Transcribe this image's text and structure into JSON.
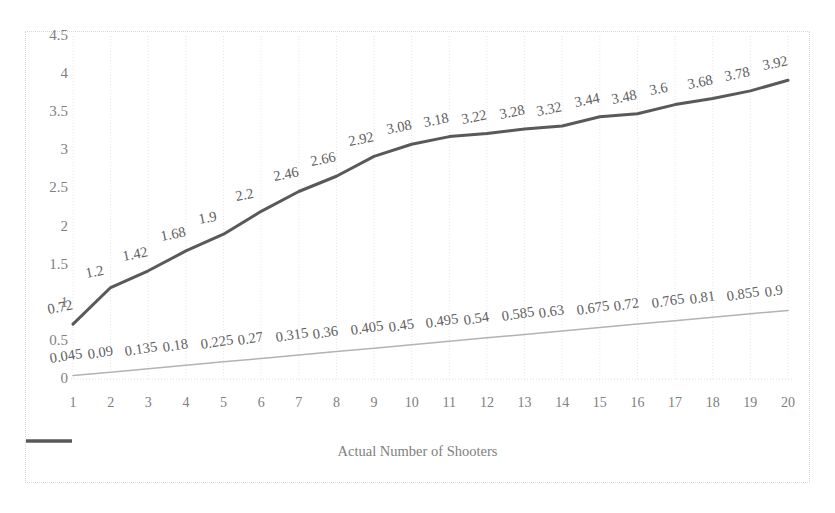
{
  "chart": {
    "background_color": "#ffffff",
    "border_color": "#d9d9d9",
    "gridline_color": "#e6e6e6",
    "axis_label_color": "#808080",
    "data_label_color": "#606060"
  },
  "legend": {
    "position": "bottom",
    "swatch_color": "#595959",
    "label": "Actual Number of Shooters"
  },
  "chart_data": {
    "type": "line",
    "title": "",
    "xlabel": "",
    "ylabel": "",
    "xlim": [
      1,
      20
    ],
    "ylim": [
      0,
      4.5
    ],
    "ytick_labels": [
      "0",
      "0.5",
      "1",
      "1.5",
      "2",
      "2.5",
      "3",
      "3.5",
      "4",
      "4.5"
    ],
    "ytick_values": [
      0,
      0.5,
      1,
      1.5,
      2,
      2.5,
      3,
      3.5,
      4,
      4.5
    ],
    "categories": [
      "1",
      "2",
      "3",
      "4",
      "5",
      "6",
      "7",
      "8",
      "9",
      "10",
      "11",
      "12",
      "13",
      "14",
      "15",
      "16",
      "17",
      "18",
      "19",
      "20"
    ],
    "grid": "vertical",
    "legend_position": "bottom",
    "series": [
      {
        "name": "Actual Number of Shooters",
        "color": "#595959",
        "width": 3,
        "labels_shown": true,
        "values": [
          0.72,
          1.2,
          1.42,
          1.68,
          1.9,
          2.2,
          2.46,
          2.66,
          2.92,
          3.08,
          3.18,
          3.22,
          3.28,
          3.32,
          3.44,
          3.48,
          3.6,
          3.68,
          3.78,
          3.92
        ],
        "value_labels": [
          "0.72",
          "1.2",
          "1.42",
          "1.68",
          "1.9",
          "2.2",
          "2.46",
          "2.66",
          "2.92",
          "3.08",
          "3.18",
          "3.22",
          "3.28",
          "3.32",
          "3.44",
          "3.48",
          "3.6",
          "3.68",
          "3.78",
          "3.92"
        ]
      },
      {
        "name": "",
        "color": "#b3b3b3",
        "width": 1.5,
        "labels_shown": true,
        "values": [
          0.045,
          0.09,
          0.135,
          0.18,
          0.225,
          0.27,
          0.315,
          0.36,
          0.405,
          0.45,
          0.495,
          0.54,
          0.585,
          0.63,
          0.675,
          0.72,
          0.765,
          0.81,
          0.855,
          0.9
        ],
        "value_labels": [
          "0.045",
          "0.09",
          "0.135",
          "0.18",
          "0.225",
          "0.27",
          "0.315",
          "0.36",
          "0.405",
          "0.45",
          "0.495",
          "0.54",
          "0.585",
          "0.63",
          "0.675",
          "0.72",
          "0.765",
          "0.81",
          "0.855",
          "0.9"
        ]
      }
    ]
  }
}
